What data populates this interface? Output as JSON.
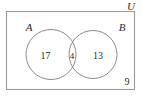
{
  "figure": {
    "type": "venn-diagram",
    "universe": {
      "label": "U",
      "outside_count": "9"
    },
    "sets": [
      {
        "id": "A",
        "label": "A",
        "only_count": "17"
      },
      {
        "id": "B",
        "label": "B",
        "only_count": "13"
      }
    ],
    "intersection": {
      "label": "A ∩ B",
      "count": "4"
    },
    "colors": {
      "stroke": "#8d8d8d",
      "frame_stroke": "#9a9a9a",
      "text": "#2b2b2b",
      "background": "#ffffff"
    }
  }
}
